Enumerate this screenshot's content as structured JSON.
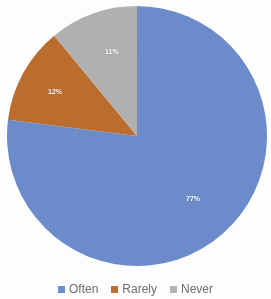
{
  "chart_data": {
    "type": "pie",
    "title": "",
    "categories": [
      "Often",
      "Rarely",
      "Never"
    ],
    "values": [
      77,
      12,
      11
    ],
    "value_labels": [
      "77%",
      "12%",
      "11%"
    ],
    "colors": [
      "#6f8fd0",
      "#c0702f",
      "#b5b5b5"
    ],
    "units": "percent",
    "start_angle_deg": 0,
    "direction": "clockwise",
    "legend_position": "bottom",
    "grid": false,
    "data_labels_shown": true,
    "slices": [
      {
        "label": "Often",
        "value": 77,
        "value_label": "77%",
        "color": "#6f8fd0"
      },
      {
        "label": "Rarely",
        "value": 12,
        "value_label": "12%",
        "color": "#c0702f"
      },
      {
        "label": "Never",
        "value": 11,
        "value_label": "11%",
        "color": "#b5b5b5"
      }
    ]
  },
  "legend": {
    "items": [
      {
        "label": "Often",
        "color": "#6f8fd0"
      },
      {
        "label": "Rarely",
        "color": "#c0702f"
      },
      {
        "label": "Never",
        "color": "#b5b5b5"
      }
    ]
  }
}
